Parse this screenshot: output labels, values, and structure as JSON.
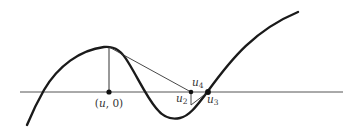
{
  "diagram": {
    "colors": {
      "curve": "#1a1a1a",
      "axis": "#555555",
      "construction": "#333333",
      "label": "#333333",
      "background": "#ffffff"
    },
    "labels": {
      "point_u0_open": "(",
      "point_u0_var": "u",
      "point_u0_rest": ", 0)",
      "u2_var": "u",
      "u2_sub": "2",
      "u3_var": "u",
      "u3_sub": "3",
      "u4_var": "u",
      "u4_sub": "4"
    },
    "elements": {
      "axis": {
        "x1": 20,
        "y1": 92,
        "x2": 343,
        "y2": 92
      },
      "curve_path": "M27,125 C34,108 40,97 44,90 C58,66 80,50 104,47 C116,46 122,52 128,62 C138,78 146,96 156,108 C163,117 170,120 180,118 C190,116 198,104 208,91 C232,58 255,30 298,12",
      "vertical_line": {
        "x1": 109,
        "y1": 47,
        "x2": 109,
        "y2": 92
      },
      "tangent_line": {
        "x1": 109,
        "y1": 47,
        "x2": 191,
        "y2": 92
      },
      "second_vertical": {
        "x1": 191,
        "y1": 92,
        "x2": 191,
        "y2": 106
      },
      "second_tangent": {
        "x1": 191,
        "y1": 106,
        "x2": 208,
        "y2": 92
      },
      "points": [
        {
          "name": "u0",
          "cx": 109,
          "cy": 92,
          "r": 2.5
        },
        {
          "name": "u2",
          "cx": 191,
          "cy": 92,
          "r": 2.2
        },
        {
          "name": "u3",
          "cx": 208,
          "cy": 92,
          "r": 2.8
        }
      ]
    }
  }
}
